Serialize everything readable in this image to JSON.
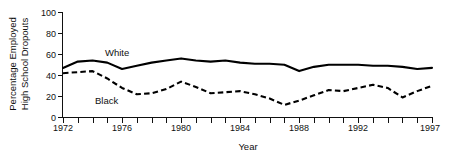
{
  "chart_data": {
    "type": "line",
    "title": "",
    "xlabel": "Year",
    "ylabel": "Percentage Employed High School Dropouts",
    "ylabel_line1": "Percentage Employed",
    "ylabel_line2": "High School Dropouts",
    "ylim": [
      0,
      100
    ],
    "xlim": [
      1972,
      1997
    ],
    "yticks": [
      0,
      20,
      40,
      60,
      80,
      100
    ],
    "ytick_labels": [
      "0",
      "20",
      "40",
      "60",
      "80",
      "100"
    ],
    "xticks": [
      1972,
      1973,
      1974,
      1975,
      1976,
      1977,
      1978,
      1979,
      1980,
      1981,
      1982,
      1983,
      1984,
      1985,
      1986,
      1987,
      1988,
      1989,
      1990,
      1991,
      1992,
      1993,
      1994,
      1995,
      1996,
      1997
    ],
    "xtick_labels_shown": [
      "1972",
      "1976",
      "1980",
      "1984",
      "1988",
      "1992",
      "1997"
    ],
    "grid": false,
    "legend_position": "inline-annotation",
    "x": [
      1972,
      1973,
      1974,
      1975,
      1976,
      1977,
      1978,
      1979,
      1980,
      1981,
      1982,
      1983,
      1984,
      1985,
      1986,
      1987,
      1988,
      1989,
      1990,
      1991,
      1992,
      1993,
      1994,
      1995,
      1996,
      1997
    ],
    "series": [
      {
        "name": "White",
        "style": "solid",
        "color": "#000000",
        "label_text": "White",
        "values": [
          47,
          53,
          54,
          52,
          46,
          49,
          53,
          55,
          54,
          54,
          52,
          51,
          50,
          44,
          47,
          50,
          50,
          50,
          49,
          49,
          47,
          46,
          56,
          55,
          39,
          43
        ]
      },
      {
        "name": "Black",
        "style": "dashed",
        "color": "#000000",
        "label_text": "Black",
        "values": [
          42,
          43,
          44,
          37,
          29,
          22,
          23,
          27,
          34,
          29,
          23,
          24,
          25,
          18,
          12,
          16,
          23,
          26,
          25,
          28,
          30,
          31,
          27,
          19,
          25,
          30
        ]
      }
    ],
    "series_white_values_full": [
      47,
      53,
      54,
      52,
      46,
      49,
      52,
      54,
      56,
      54,
      53,
      54,
      52,
      51,
      51,
      50,
      44,
      48,
      50,
      50,
      50,
      49,
      49,
      48,
      46,
      47
    ],
    "series_black_values_full": [
      42,
      43,
      44,
      37,
      28,
      22,
      23,
      27,
      34,
      29,
      23,
      24,
      25,
      22,
      18,
      12,
      16,
      21,
      26,
      25,
      28,
      31,
      28,
      19,
      25,
      30
    ],
    "annotations": [
      {
        "text": "White",
        "x_px": 105,
        "y_px": 55
      },
      {
        "text": "Black",
        "x_px": 95,
        "y_px": 103
      }
    ]
  },
  "axis": {
    "y_label_line1": "Percentage Employed",
    "y_label_line2": "High School Dropouts",
    "x_label": "Year",
    "y_ticks": [
      "100",
      "80",
      "60",
      "40",
      "20",
      "0"
    ],
    "x_ticks": [
      "1972",
      "1976",
      "1980",
      "1984",
      "1988",
      "1992",
      "1997"
    ]
  },
  "colors": {
    "ink": "#000000",
    "background": "#ffffff"
  }
}
